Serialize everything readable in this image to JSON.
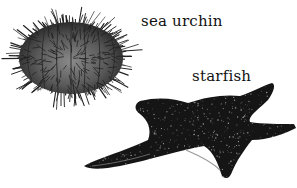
{
  "illustration": {
    "subjects": [
      {
        "id": "sea-urchin",
        "label": "sea urchin"
      },
      {
        "id": "starfish",
        "label": "starfish"
      }
    ],
    "colors": {
      "background": "#ffffff",
      "urchin_body": "#6a6a6a",
      "urchin_spines": "#222222",
      "starfish_body": "#141414",
      "starfish_dots": "#bfbfbf",
      "label_text": "#111111"
    }
  }
}
